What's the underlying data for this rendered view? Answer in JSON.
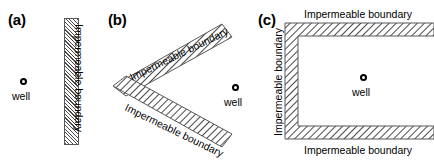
{
  "figure": {
    "width": 434,
    "height": 163,
    "background": "#ffffff",
    "hatch_color": "#4a4a4c",
    "outline_color": "#58585a",
    "text_color": "#000000"
  },
  "panels": [
    {
      "id": "a",
      "label": "(a)",
      "well": {
        "label": "well"
      },
      "boundaries": [
        {
          "id": "a-right",
          "label": "Impermeable boundary",
          "orientation": "vertical"
        }
      ]
    },
    {
      "id": "b",
      "label": "(b)",
      "well": {
        "label": "well"
      },
      "boundaries": [
        {
          "id": "b-upper",
          "label": "Impermeable boundary",
          "orientation": "diagonal-up"
        },
        {
          "id": "b-lower",
          "label": "Impermeable boundary",
          "orientation": "diagonal-down"
        }
      ]
    },
    {
      "id": "c",
      "label": "(c)",
      "well": {
        "label": "well"
      },
      "boundaries": [
        {
          "id": "c-top",
          "label": "Impermeable boundary",
          "orientation": "horizontal"
        },
        {
          "id": "c-left",
          "label": "Impermeable boundary",
          "orientation": "vertical"
        },
        {
          "id": "c-bottom",
          "label": "Impermeable boundary",
          "orientation": "horizontal"
        }
      ]
    }
  ]
}
